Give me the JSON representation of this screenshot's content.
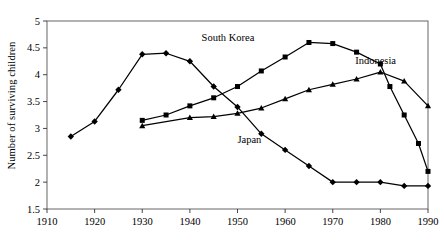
{
  "chart_data": {
    "type": "line",
    "title": "",
    "xlabel": "",
    "ylabel": "Number of surviving children",
    "xlim": [
      1910,
      1990
    ],
    "ylim": [
      1.5,
      5
    ],
    "xticks": [
      1910,
      1920,
      1930,
      1940,
      1950,
      1960,
      1970,
      1980,
      1990
    ],
    "yticks": [
      1.5,
      2,
      2.5,
      3,
      3.5,
      4,
      4.5,
      5
    ],
    "ytick_labels": [
      "1.5",
      "2",
      "2.5",
      "3",
      "3.5",
      "4",
      "4.5",
      "5"
    ],
    "xtick_labels": [
      "1910",
      "1920",
      "1930",
      "1940",
      "1950",
      "1960",
      "1970",
      "1980",
      "1990"
    ],
    "grid": false,
    "legend": "inline-annotations",
    "series": [
      {
        "name": "Japan",
        "marker": "diamond",
        "color": "#000000",
        "label_position": {
          "x": 1952.5,
          "y": 2.72
        },
        "points": [
          {
            "x": 1915,
            "y": 2.85
          },
          {
            "x": 1920,
            "y": 3.13
          },
          {
            "x": 1925,
            "y": 3.72
          },
          {
            "x": 1930,
            "y": 4.38
          },
          {
            "x": 1935,
            "y": 4.4
          },
          {
            "x": 1940,
            "y": 4.25
          },
          {
            "x": 1945,
            "y": 3.78
          },
          {
            "x": 1950,
            "y": 3.4
          },
          {
            "x": 1955,
            "y": 2.9
          },
          {
            "x": 1960,
            "y": 2.6
          },
          {
            "x": 1965,
            "y": 2.3
          },
          {
            "x": 1970,
            "y": 2.0
          },
          {
            "x": 1975,
            "y": 2.0
          },
          {
            "x": 1980,
            "y": 2.0
          },
          {
            "x": 1985,
            "y": 1.93
          },
          {
            "x": 1990,
            "y": 1.93
          }
        ]
      },
      {
        "name": "South Korea",
        "marker": "square",
        "color": "#000000",
        "label_position": {
          "x": 1948,
          "y": 4.62
        },
        "points": [
          {
            "x": 1930,
            "y": 3.15
          },
          {
            "x": 1935,
            "y": 3.25
          },
          {
            "x": 1940,
            "y": 3.42
          },
          {
            "x": 1945,
            "y": 3.57
          },
          {
            "x": 1950,
            "y": 3.78
          },
          {
            "x": 1955,
            "y": 4.07
          },
          {
            "x": 1960,
            "y": 4.33
          },
          {
            "x": 1965,
            "y": 4.6
          },
          {
            "x": 1970,
            "y": 4.58
          },
          {
            "x": 1975,
            "y": 4.42
          },
          {
            "x": 1980,
            "y": 4.2
          },
          {
            "x": 1982,
            "y": 3.78
          },
          {
            "x": 1985,
            "y": 3.25
          },
          {
            "x": 1988,
            "y": 2.72
          },
          {
            "x": 1990,
            "y": 2.2
          }
        ]
      },
      {
        "name": "Indonesia",
        "marker": "triangle",
        "color": "#000000",
        "label_position": {
          "x": 1979,
          "y": 4.2
        },
        "points": [
          {
            "x": 1930,
            "y": 3.05
          },
          {
            "x": 1940,
            "y": 3.2
          },
          {
            "x": 1945,
            "y": 3.22
          },
          {
            "x": 1950,
            "y": 3.28
          },
          {
            "x": 1955,
            "y": 3.38
          },
          {
            "x": 1960,
            "y": 3.55
          },
          {
            "x": 1965,
            "y": 3.72
          },
          {
            "x": 1970,
            "y": 3.82
          },
          {
            "x": 1975,
            "y": 3.92
          },
          {
            "x": 1980,
            "y": 4.05
          },
          {
            "x": 1985,
            "y": 3.88
          },
          {
            "x": 1990,
            "y": 3.42
          }
        ]
      }
    ]
  }
}
